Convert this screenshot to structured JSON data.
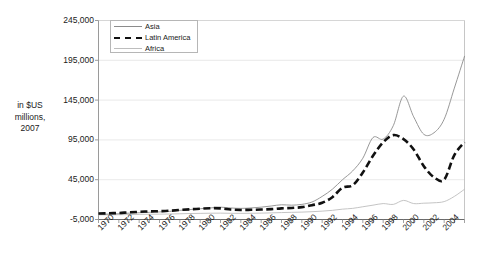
{
  "chart_data": {
    "type": "line",
    "title": "",
    "subtitle": "",
    "xlabel": "",
    "ylabel": "in $US\nmillions,\n2007",
    "ylim": [
      -5000,
      245000
    ],
    "ytick_values": [
      245000,
      195000,
      145000,
      95000,
      45000,
      -5000
    ],
    "ytick_labels": [
      "245,000",
      "195,000",
      "145,000",
      "95,000",
      "45,000",
      "-5,000"
    ],
    "grid": true,
    "legend_position": "top-left-inside",
    "xlim": [
      1970,
      2006
    ],
    "xtick_labels": [
      "1970",
      "1972",
      "1974",
      "1976",
      "1978",
      "1980",
      "1982",
      "1984",
      "1986",
      "1988",
      "1990",
      "1992",
      "1994",
      "1996",
      "1998",
      "2000",
      "2002",
      "2004"
    ],
    "x": [
      1970,
      1971,
      1972,
      1973,
      1974,
      1975,
      1976,
      1977,
      1978,
      1979,
      1980,
      1981,
      1982,
      1983,
      1984,
      1985,
      1986,
      1987,
      1988,
      1989,
      1990,
      1991,
      1992,
      1993,
      1994,
      1995,
      1996,
      1997,
      1998,
      1999,
      2000,
      2001,
      2002,
      2003,
      2004,
      2005,
      2006
    ],
    "series": [
      {
        "name": "Asia",
        "color": "#8c8c8c",
        "style": "solid",
        "values": [
          1500,
          1800,
          2200,
          3000,
          3500,
          4000,
          4500,
          5200,
          6500,
          7500,
          8500,
          9500,
          10500,
          9500,
          9000,
          9500,
          10500,
          12000,
          13500,
          13000,
          14000,
          17000,
          24000,
          33000,
          45000,
          56000,
          72000,
          98000,
          96000,
          113000,
          150000,
          124000,
          102000,
          104000,
          121000,
          160000,
          200000
        ]
      },
      {
        "name": "Latin America",
        "color": "#111111",
        "style": "dashed",
        "values": [
          2500,
          2800,
          3200,
          4000,
          4600,
          5200,
          5500,
          6000,
          7000,
          7800,
          8500,
          9200,
          9000,
          7500,
          7000,
          7200,
          7500,
          8000,
          9000,
          9500,
          10500,
          13000,
          16000,
          23000,
          35000,
          38000,
          54000,
          75000,
          92000,
          101000,
          96000,
          83000,
          62000,
          48000,
          45000,
          76000,
          92000
        ]
      },
      {
        "name": "Africa",
        "color": "#bdbdbd",
        "style": "solid",
        "values": [
          800,
          900,
          1000,
          1200,
          1400,
          1600,
          1700,
          1900,
          2200,
          2500,
          2700,
          2900,
          3000,
          2800,
          2700,
          2800,
          3000,
          3300,
          3700,
          4000,
          4300,
          4800,
          5500,
          6500,
          8000,
          9000,
          11000,
          13000,
          15000,
          14000,
          19000,
          15000,
          15500,
          16000,
          17500,
          24000,
          33000
        ]
      }
    ]
  },
  "legend": {
    "items": [
      {
        "label": "Asia"
      },
      {
        "label": "Latin America"
      },
      {
        "label": "Africa"
      }
    ]
  }
}
